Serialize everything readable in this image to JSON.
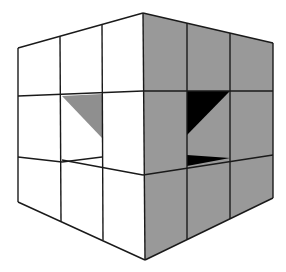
{
  "figure": {
    "colors": {
      "background": "#ffffff",
      "left_face": "#ffffff",
      "right_face": "#999999",
      "left_cavity_shadow": "#8f8f8f",
      "right_cavity_shadow": "#000000",
      "edge": "#1a1a1a"
    },
    "grid": {
      "rows": 3,
      "cols_per_face": 3
    }
  }
}
